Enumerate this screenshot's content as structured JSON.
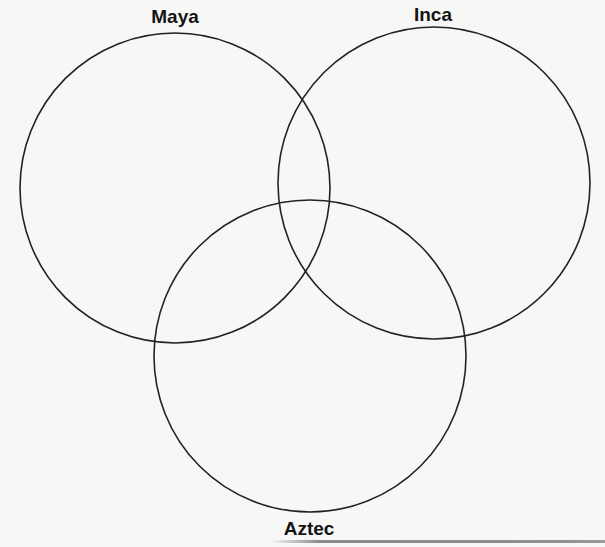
{
  "diagram": {
    "type": "venn",
    "sets": [
      {
        "id": "maya",
        "label": "Maya",
        "cx": 175,
        "cy": 188,
        "r": 155,
        "label_x": 175,
        "label_y": 7
      },
      {
        "id": "inca",
        "label": "Inca",
        "cx": 434,
        "cy": 183,
        "r": 156,
        "label_x": 433,
        "label_y": 5
      },
      {
        "id": "aztec",
        "label": "Aztec",
        "cx": 310,
        "cy": 356,
        "r": 156,
        "label_x": 309,
        "label_y": 519
      }
    ],
    "stroke_color": "#222222",
    "stroke_width": 1.6,
    "background": "#f7f7f6"
  }
}
